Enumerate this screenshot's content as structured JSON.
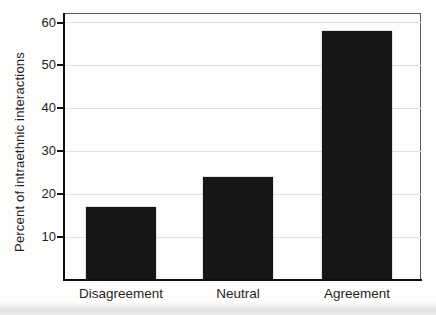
{
  "figure": {
    "background": "#fdfdfc",
    "bar_color": "#161616",
    "gridline_color": "#e2e1df",
    "axis_color": "#0e0e0e",
    "frame_color": "#5a5a5a",
    "text_color": "#1f1f1f"
  },
  "chart_data": {
    "type": "bar",
    "title": "",
    "categories": [
      "Disagreement",
      "Neutral",
      "Agreement"
    ],
    "values": [
      17,
      24,
      58
    ],
    "xlabel": "",
    "ylabel": "Percent of intraethnic interactions",
    "yticks": [
      10,
      20,
      30,
      40,
      50,
      60
    ],
    "ylim": [
      0,
      62
    ],
    "grid": true,
    "legend": "none",
    "bar_width_px": 70,
    "bar_centers_px": [
      56,
      173,
      292
    ]
  }
}
